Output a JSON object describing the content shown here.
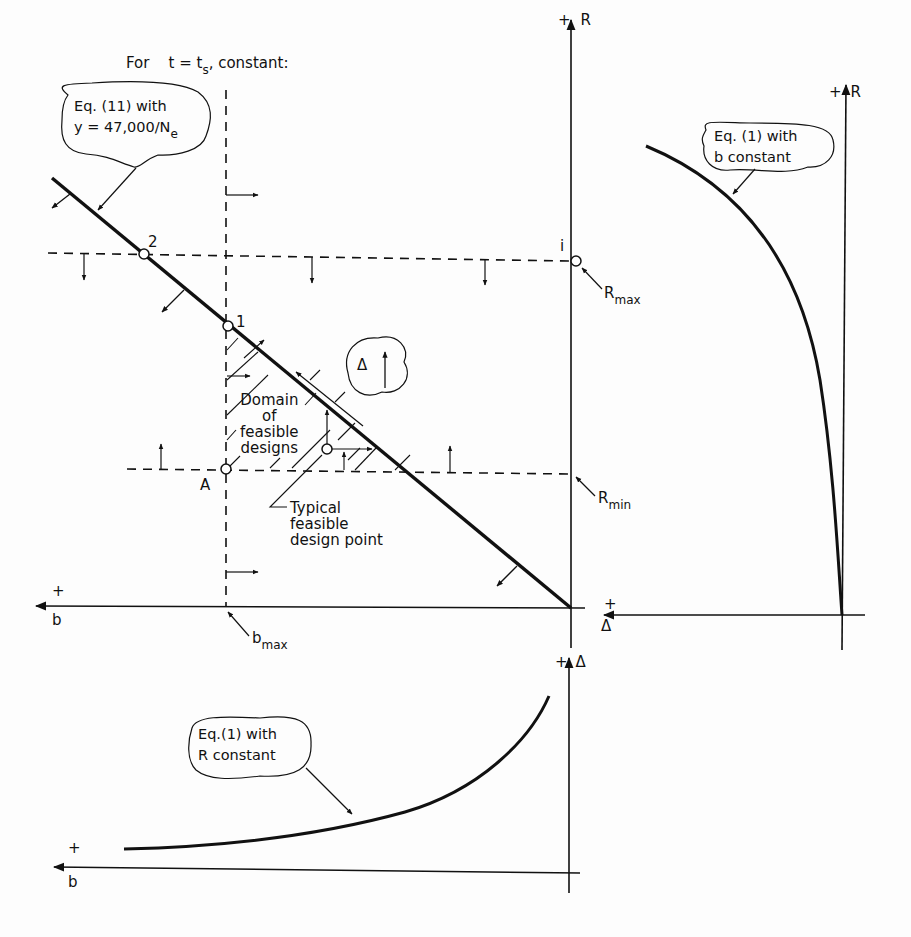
{
  "header": {
    "condition_prefix": "For",
    "condition_expr": "t = t",
    "condition_sub": "s",
    "condition_suffix": ", constant:"
  },
  "main_plot": {
    "r_axis": {
      "plus": "+",
      "label": "R"
    },
    "b_axis": {
      "plus": "+",
      "label": "b"
    },
    "delta_axis_stub": {
      "plus": "+",
      "label": "Δ"
    },
    "constraint_line_bubble": {
      "line1": "Eq. (11) with",
      "line2_prefix": "y = 47,000/N",
      "line2_sub": "e"
    },
    "points": {
      "p1": "1",
      "p2": "2",
      "pA": "A",
      "pi": "i"
    },
    "r_max": {
      "base": "R",
      "sub": "max"
    },
    "r_min": {
      "base": "R",
      "sub": "min"
    },
    "b_max": {
      "base": "b",
      "sub": "max"
    },
    "domain_label": [
      "Domain",
      "of",
      "feasible",
      "designs"
    ],
    "delta_bubble": "Δ",
    "typical_point_label": [
      "Typical",
      "feasible",
      "design point"
    ]
  },
  "right_plot": {
    "r_axis": {
      "plus": "+",
      "label": "R"
    },
    "bubble": {
      "line1": "Eq. (1) with",
      "line2": "b  constant"
    }
  },
  "bottom_plot": {
    "delta_axis": {
      "plus": "+",
      "label": "Δ"
    },
    "b_axis": {
      "plus": "+",
      "label": "b"
    },
    "bubble": {
      "line1": "Eq.(1) with",
      "line2": "R  constant"
    }
  }
}
